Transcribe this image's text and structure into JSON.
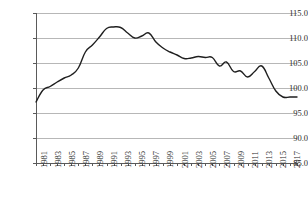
{
  "chart_data": {
    "type": "line",
    "title": "",
    "subtitle": "",
    "xlabel": "",
    "ylabel": "",
    "ylim": [
      85.0,
      115.0
    ],
    "ytick_step": 5.0,
    "ytick_labels": [
      "115.0",
      "110.0",
      "105.0",
      "100.0",
      "95.0",
      "90.0",
      "85.0"
    ],
    "ytick_values": [
      115.0,
      110.0,
      105.0,
      100.0,
      95.0,
      90.0,
      85.0
    ],
    "grid": true,
    "grid_orientation": "horizontal",
    "legend": false,
    "legend_position": "none",
    "xlim": [
      1981,
      2018
    ],
    "xtick_rotation": -90,
    "xtick_label_interval": 2,
    "xtick_labels": [
      "1981",
      "1983",
      "1985",
      "1987",
      "1989",
      "1991",
      "1993",
      "1995",
      "1997",
      "1999",
      "2001",
      "2003",
      "2005",
      "2007",
      "2009",
      "2011",
      "2013",
      "2015",
      "2017"
    ],
    "line_color": "#1f1f1f",
    "grid_color": "#b7b7b7",
    "axis_color": "#5a5a5a",
    "x": [
      1981,
      1982,
      1983,
      1984,
      1985,
      1986,
      1987,
      1988,
      1989,
      1990,
      1991,
      1992,
      1993,
      1994,
      1995,
      1996,
      1997,
      1998,
      1999,
      2000,
      2001,
      2002,
      2003,
      2004,
      2005,
      2006,
      2007,
      2008,
      2009,
      2010,
      2011,
      2012,
      2013,
      2014,
      2015,
      2016,
      2017,
      2018
    ],
    "categories": [
      "1981",
      "1982",
      "1983",
      "1984",
      "1985",
      "1986",
      "1987",
      "1988",
      "1989",
      "1990",
      "1991",
      "1992",
      "1993",
      "1994",
      "1995",
      "1996",
      "1997",
      "1998",
      "1999",
      "2000",
      "2001",
      "2002",
      "2003",
      "2004",
      "2005",
      "2006",
      "2007",
      "2008",
      "2009",
      "2010",
      "2011",
      "2012",
      "2013",
      "2014",
      "2015",
      "2016",
      "2017",
      "2018"
    ],
    "values": [
      97.2,
      99.6,
      100.3,
      101.2,
      102.0,
      102.6,
      104.0,
      107.2,
      108.6,
      110.2,
      111.9,
      112.2,
      112.1,
      111.0,
      110.0,
      110.4,
      111.0,
      109.2,
      108.0,
      107.2,
      106.6,
      105.9,
      106.0,
      106.3,
      106.1,
      106.1,
      104.4,
      105.2,
      103.3,
      103.4,
      102.2,
      103.3,
      104.4,
      102.0,
      99.4,
      98.2,
      98.2,
      98.2
    ],
    "series": [
      {
        "name": "index",
        "values": [
          97.2,
          99.6,
          100.3,
          101.2,
          102.0,
          102.6,
          104.0,
          107.2,
          108.6,
          110.2,
          111.9,
          112.2,
          112.1,
          111.0,
          110.0,
          110.4,
          111.0,
          109.2,
          108.0,
          107.2,
          106.6,
          105.9,
          106.0,
          106.3,
          106.1,
          106.1,
          104.4,
          105.2,
          103.3,
          103.4,
          102.2,
          103.3,
          104.4,
          102.0,
          99.4,
          98.2,
          98.2,
          98.2
        ]
      }
    ]
  }
}
